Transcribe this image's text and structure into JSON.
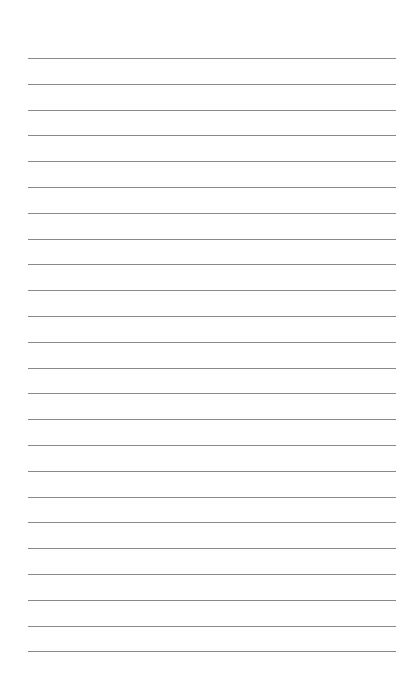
{
  "page": {
    "type": "lined-paper",
    "line_count": 24,
    "first_line_y": 58,
    "line_spacing": 25.8,
    "line_color": "#8a8a8a",
    "background": "#ffffff"
  }
}
